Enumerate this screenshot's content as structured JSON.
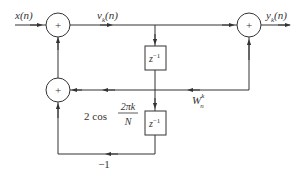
{
  "diagram": {
    "labels": {
      "input": "x(n)",
      "state": "v",
      "state_sub": "k",
      "state_arg": "(n)",
      "output": "y",
      "output_sub": "k",
      "output_arg": "(n)",
      "delay1_base": "z",
      "delay1_exp": "−1",
      "delay2_base": "z",
      "delay2_exp": "−1",
      "coef_prefix": "2 cos",
      "coef_num": "2πk",
      "coef_den": "N",
      "twiddle_base": "W",
      "twiddle_sub": "n",
      "twiddle_sup": "k",
      "neg_gain": "−1",
      "adder_symbol": "+"
    },
    "colors": {
      "stroke": "#333333",
      "background": "#ffffff"
    }
  }
}
